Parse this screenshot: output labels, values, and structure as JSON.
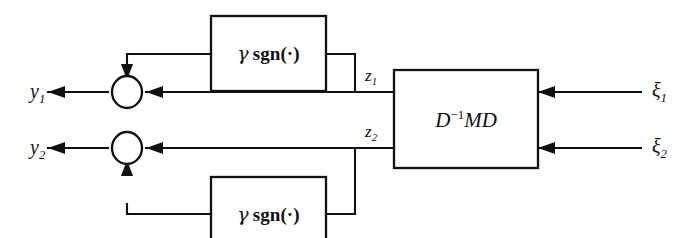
{
  "figure": {
    "kind": "control-block-diagram",
    "background_color": "#ffffff",
    "line_color": "#111111"
  },
  "blocks": {
    "plant": {
      "label_html": "D<sup>&#8722;1</sup>MD",
      "name": "plant-block"
    },
    "nonlinear_top": {
      "gamma": "γ",
      "func": "sgn(·)",
      "name": "gamma-sgn-block-top"
    },
    "nonlinear_bottom": {
      "gamma": "γ",
      "func": "sgn(·)",
      "name": "gamma-sgn-block-bottom"
    }
  },
  "signals": {
    "outputs": [
      {
        "label_html": "y<sub>1</sub>",
        "name": "output-y1"
      },
      {
        "label_html": "y<sub>2</sub>",
        "name": "output-y2"
      }
    ],
    "internal": [
      {
        "label_html": "z<sub>1</sub>",
        "name": "signal-z1"
      },
      {
        "label_html": "z<sub>2</sub>",
        "name": "signal-z2"
      }
    ],
    "inputs": [
      {
        "label_html": "ξ<sub>1</sub>",
        "name": "input-xi1"
      },
      {
        "label_html": "ξ<sub>2</sub>",
        "name": "input-xi2"
      }
    ]
  },
  "junctions": [
    {
      "name": "summing-junction-1"
    },
    {
      "name": "summing-junction-2"
    }
  ]
}
